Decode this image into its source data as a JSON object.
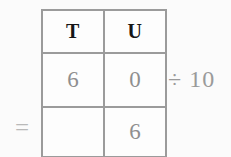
{
  "worksheet": {
    "equals_sign": "=",
    "operation_annotation": "÷ 10",
    "table": {
      "columns": [
        {
          "header": "T",
          "name": "tens"
        },
        {
          "header": "U",
          "name": "units"
        }
      ],
      "rows": [
        {
          "name": "dividend-row",
          "cells": [
            "6",
            "0"
          ]
        },
        {
          "name": "answer-row",
          "cells": [
            "",
            "6"
          ]
        }
      ]
    },
    "colors": {
      "background": "#fbfbfb",
      "cell_background": "#fdfdfd",
      "grid_line": "#9b9b9b",
      "header_text": "#161616",
      "digit_text": "#8f8f8f",
      "annotation_text": "#9a9a9a",
      "equals_text": "#b9b9b9"
    }
  }
}
